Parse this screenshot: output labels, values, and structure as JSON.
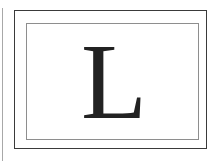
{
  "card": {
    "letter": "L",
    "colors": {
      "letter": "#222222",
      "outer_border": "#3a3a3a",
      "inner_border": "#8e8e8e",
      "left_rule": "#a8a8a8",
      "background": "#ffffff"
    }
  }
}
